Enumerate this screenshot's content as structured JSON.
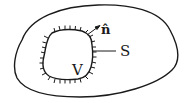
{
  "diagram": {
    "labels": {
      "normal": "n̂",
      "surface": "S",
      "volume": "V"
    },
    "colors": {
      "stroke": "#1a1a1a",
      "background": "#ffffff"
    }
  }
}
